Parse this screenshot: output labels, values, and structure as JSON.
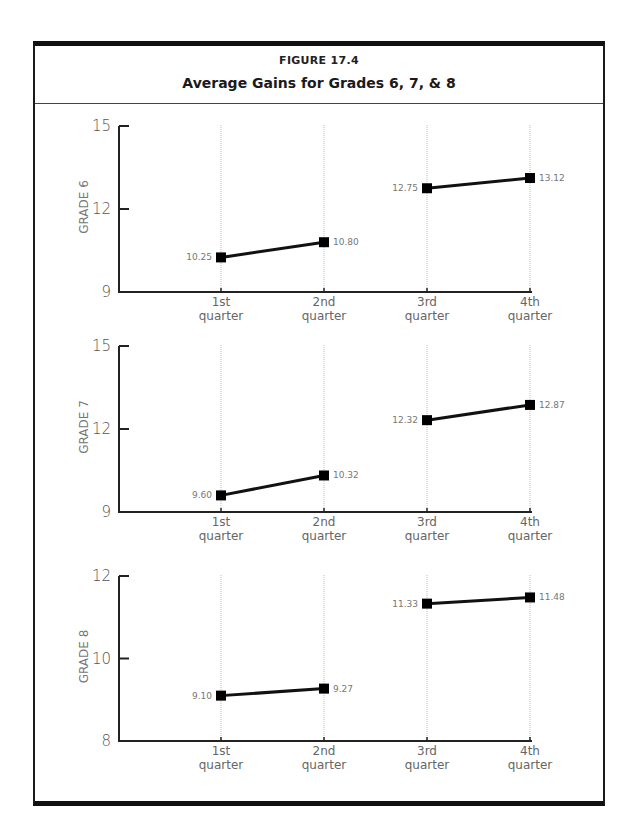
{
  "figure": {
    "label": "FIGURE 17.4",
    "title": "Average Gains for Grades 6, 7, & 8"
  },
  "colors": {
    "line": "#111111",
    "marker": "#000000",
    "gridline": "#aaaaaa",
    "axis": "#222222",
    "text": "#666666"
  },
  "chart_data": [
    {
      "type": "line",
      "title": "Average Gains for Grades 6, 7, & 8",
      "ylabel": "GRADE 6",
      "xlabel": "",
      "categories": [
        "1st quarter",
        "2nd quarter",
        "3rd quarter",
        "4th quarter"
      ],
      "category_lines": [
        [
          "1st",
          "quarter"
        ],
        [
          "2nd",
          "quarter"
        ],
        [
          "3rd",
          "quarter"
        ],
        [
          "4th",
          "quarter"
        ]
      ],
      "ylim": [
        9,
        15
      ],
      "yticks": [
        9,
        12,
        15
      ],
      "grid": "vertical dotted at each quarter",
      "segments": [
        [
          0,
          1
        ],
        [
          2,
          3
        ]
      ],
      "values": [
        10.25,
        10.8,
        12.75,
        13.12
      ],
      "value_labels": [
        "10.25",
        "10.80",
        "12.75",
        "13.12"
      ]
    },
    {
      "type": "line",
      "title": "Average Gains for Grades 6, 7, & 8",
      "ylabel": "GRADE 7",
      "xlabel": "",
      "categories": [
        "1st quarter",
        "2nd quarter",
        "3rd quarter",
        "4th quarter"
      ],
      "category_lines": [
        [
          "1st",
          "quarter"
        ],
        [
          "2nd",
          "quarter"
        ],
        [
          "3rd",
          "quarter"
        ],
        [
          "4th",
          "quarter"
        ]
      ],
      "ylim": [
        9,
        15
      ],
      "yticks": [
        9,
        12,
        15
      ],
      "grid": "vertical dotted at each quarter",
      "segments": [
        [
          0,
          1
        ],
        [
          2,
          3
        ]
      ],
      "values": [
        9.6,
        10.32,
        12.32,
        12.87
      ],
      "value_labels": [
        "9.60",
        "10.32",
        "12.32",
        "12.87"
      ]
    },
    {
      "type": "line",
      "title": "Average Gains for Grades 6, 7, & 8",
      "ylabel": "GRADE 8",
      "xlabel": "",
      "categories": [
        "1st quarter",
        "2nd quarter",
        "3rd quarter",
        "4th quarter"
      ],
      "category_lines": [
        [
          "1st",
          "quarter"
        ],
        [
          "2nd",
          "quarter"
        ],
        [
          "3rd",
          "quarter"
        ],
        [
          "4th",
          "quarter"
        ]
      ],
      "ylim": [
        8,
        12
      ],
      "yticks": [
        8,
        10,
        12
      ],
      "grid": "vertical dotted at each quarter",
      "segments": [
        [
          0,
          1
        ],
        [
          2,
          3
        ]
      ],
      "values": [
        9.1,
        9.27,
        11.33,
        11.48
      ],
      "value_labels": [
        "9.10",
        "9.27",
        "11.33",
        "11.48"
      ]
    }
  ]
}
